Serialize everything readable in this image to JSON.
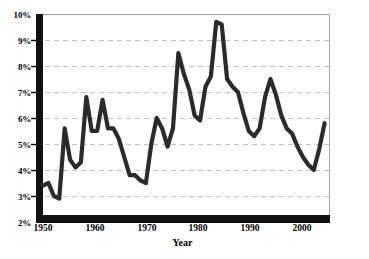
{
  "chart_data": {
    "type": "line",
    "title": "",
    "subtitle": "",
    "xlabel": "Year",
    "ylabel": "",
    "xlim": [
      1950,
      2003
    ],
    "ylim": [
      2,
      10
    ],
    "grid": true,
    "grid_style": "dashed-horizontal",
    "legend": "none",
    "source_note": "Source: Bureau of Labor Statistics",
    "line_color": "#2b2b2b",
    "grid_color": "#b9c4cf",
    "axis_color": "#000000",
    "series_name": "Unemployment rate",
    "y_tick_labels": [
      "10%",
      "9%",
      "8%",
      "7%",
      "6%",
      "5%",
      "4%",
      "3%",
      "2%"
    ],
    "y_tick_values": [
      10,
      9,
      8,
      7,
      6,
      5,
      4,
      3,
      2
    ],
    "x_tick_labels": [
      "1950",
      "1960",
      "1970",
      "1980",
      "1990",
      "2000"
    ],
    "x_tick_values": [
      1950,
      1960,
      1970,
      1980,
      1990,
      2000
    ],
    "x": [
      1950,
      1951,
      1952,
      1953,
      1954,
      1955,
      1956,
      1957,
      1958,
      1959,
      1960,
      1961,
      1962,
      1963,
      1964,
      1965,
      1966,
      1967,
      1968,
      1969,
      1970,
      1971,
      1972,
      1973,
      1974,
      1975,
      1976,
      1977,
      1978,
      1979,
      1980,
      1981,
      1982,
      1983,
      1984,
      1985,
      1986,
      1987,
      1988,
      1989,
      1990,
      1991,
      1992,
      1993,
      1994,
      1995,
      1996,
      1997,
      1998,
      1999,
      2000,
      2001,
      2002
    ],
    "values": [
      3.4,
      3.5,
      3.0,
      2.9,
      5.6,
      4.4,
      4.1,
      4.3,
      6.8,
      5.5,
      5.5,
      6.7,
      5.6,
      5.6,
      5.2,
      4.5,
      3.8,
      3.8,
      3.6,
      3.5,
      5.0,
      6.0,
      5.6,
      4.9,
      5.6,
      8.5,
      7.7,
      7.1,
      6.1,
      5.9,
      7.2,
      7.6,
      9.7,
      9.6,
      7.5,
      7.2,
      7.0,
      6.2,
      5.5,
      5.3,
      5.6,
      6.8,
      7.5,
      6.9,
      6.1,
      5.6,
      5.4,
      4.9,
      4.5,
      4.2,
      4.0,
      4.8,
      5.8
    ]
  },
  "axis": {
    "x_title": "Year"
  },
  "source": {
    "text": "Source: Bureau of Labor Statistics"
  }
}
